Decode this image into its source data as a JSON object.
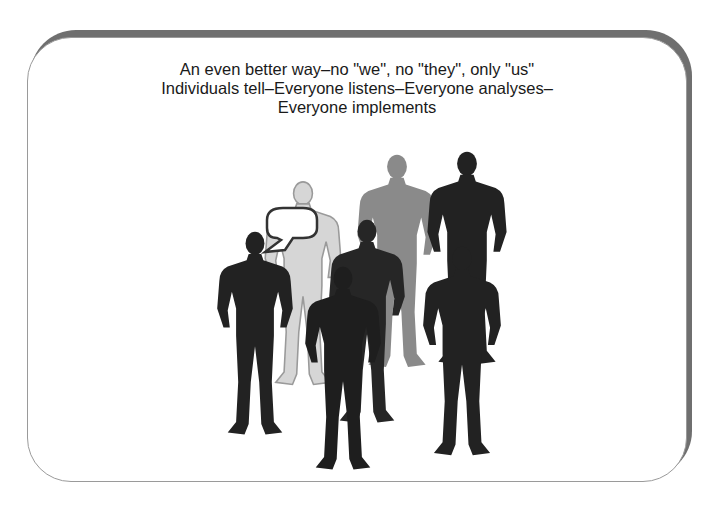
{
  "slide": {
    "caption_lines": [
      "An even better way–no \"we\", no \"they\", only \"us\"",
      "Individuals tell–Everyone listens–Everyone analyses–",
      "Everyone implements"
    ]
  },
  "figure": {
    "speech_bubble_text": "",
    "colors": {
      "dark_figure": "#222222",
      "mid_figure": "#8a8a8a",
      "light_figure": "#d6d6d6",
      "outline": "#9a9a9a",
      "card_shadow": "#6f6f6f"
    }
  }
}
